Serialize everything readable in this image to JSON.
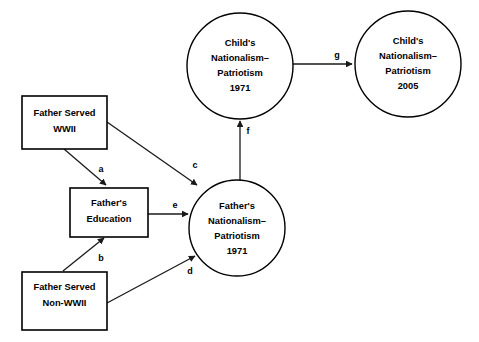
{
  "diagram": {
    "background_color": "#ffffff",
    "stroke_color": "#000000",
    "nodes": [
      {
        "id": "father-served-wwii",
        "shape": "rect",
        "lines": [
          "Father Served",
          "WWII"
        ]
      },
      {
        "id": "fathers-education",
        "shape": "rect",
        "lines": [
          "Father's",
          "Education"
        ]
      },
      {
        "id": "father-served-non-wwii",
        "shape": "rect",
        "lines": [
          "Father Served",
          "Non-WWII"
        ]
      },
      {
        "id": "fathers-nationalism-1971",
        "shape": "circle",
        "lines": [
          "Father's",
          "Nationalism–",
          "Patriotism",
          "1971"
        ]
      },
      {
        "id": "childs-nationalism-1971",
        "shape": "circle",
        "lines": [
          "Child's",
          "Nationalism–",
          "Patriotism",
          "1971"
        ]
      },
      {
        "id": "childs-nationalism-2005",
        "shape": "circle",
        "lines": [
          "Child's",
          "Nationalism–",
          "Patriotism",
          "2005"
        ]
      }
    ],
    "paths": [
      {
        "id": "a",
        "label": "a",
        "from": "father-served-wwii",
        "to": "fathers-education"
      },
      {
        "id": "b",
        "label": "b",
        "from": "father-served-non-wwii",
        "to": "fathers-education"
      },
      {
        "id": "c",
        "label": "c",
        "from": "father-served-wwii",
        "to": "fathers-nationalism-1971"
      },
      {
        "id": "d",
        "label": "d",
        "from": "father-served-non-wwii",
        "to": "fathers-nationalism-1971"
      },
      {
        "id": "e",
        "label": "e",
        "from": "fathers-education",
        "to": "fathers-nationalism-1971"
      },
      {
        "id": "f",
        "label": "f",
        "from": "fathers-nationalism-1971",
        "to": "childs-nationalism-1971"
      },
      {
        "id": "g",
        "label": "g",
        "from": "childs-nationalism-1971",
        "to": "childs-nationalism-2005"
      }
    ]
  }
}
